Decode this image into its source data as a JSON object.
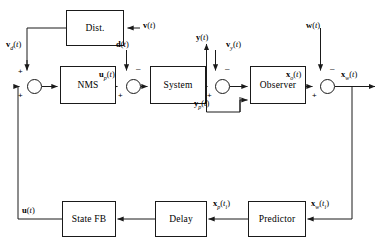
{
  "diagram": {
    "blocks": [
      {
        "id": "dist",
        "label": "Dist.",
        "x": 66,
        "y": 10,
        "w": 58,
        "h": 36
      },
      {
        "id": "nms",
        "label": "NMS",
        "x": 60,
        "y": 66,
        "w": 56,
        "h": 38
      },
      {
        "id": "system",
        "label": "System",
        "x": 150,
        "y": 66,
        "w": 56,
        "h": 38
      },
      {
        "id": "observer",
        "label": "Observer",
        "x": 250,
        "y": 66,
        "w": 56,
        "h": 38
      },
      {
        "id": "statefb",
        "label": "State FB",
        "x": 62,
        "y": 201,
        "w": 54,
        "h": 36
      },
      {
        "id": "delay",
        "label": "Delay",
        "x": 155,
        "y": 201,
        "w": 52,
        "h": 36
      },
      {
        "id": "predictor",
        "label": "Predictor",
        "x": 248,
        "y": 201,
        "w": 58,
        "h": 36
      }
    ],
    "junctions": [
      {
        "id": "sum-input",
        "x": 27,
        "y": 79,
        "d": 15
      },
      {
        "id": "sum-plant-input",
        "x": 126,
        "y": 79,
        "d": 15
      },
      {
        "id": "sum-output",
        "x": 215,
        "y": 79,
        "d": 15
      },
      {
        "id": "sum-state",
        "x": 320,
        "y": 79,
        "d": 15
      }
    ],
    "signals": [
      {
        "id": "v",
        "text": "v(t)",
        "x": 143,
        "y": 12
      },
      {
        "id": "vd",
        "text": "vd(t)",
        "x": 8,
        "y": 40
      },
      {
        "id": "d",
        "text": "d(t)",
        "x": 117,
        "y": 40
      },
      {
        "id": "up",
        "text": "up(t)",
        "x": 100,
        "y": 66
      },
      {
        "id": "y",
        "text": "y(t)",
        "x": 197,
        "y": 32
      },
      {
        "id": "vy",
        "text": "vy(t)",
        "x": 228,
        "y": 40
      },
      {
        "id": "yp",
        "text": "yp(t)",
        "x": 196,
        "y": 97
      },
      {
        "id": "w",
        "text": "w(t)",
        "x": 307,
        "y": 12
      },
      {
        "id": "xo",
        "text": "xo(t)",
        "x": 309,
        "y": 66
      },
      {
        "id": "xw",
        "text": "xw(t)",
        "x": 341,
        "y": 66
      },
      {
        "id": "u",
        "text": "u(t)",
        "x": 24,
        "y": 203
      },
      {
        "id": "xp",
        "text": "xp(ti)",
        "x": 214,
        "y": 196
      },
      {
        "id": "xwi",
        "text": "xw(ti)",
        "x": 312,
        "y": 196
      }
    ],
    "signs": [
      {
        "id": "sum-input-plus-top",
        "text": "+",
        "x": 18,
        "y": 68
      },
      {
        "id": "sum-input-plus-bottom",
        "text": "+",
        "x": 18,
        "y": 92
      },
      {
        "id": "sum-plant-plus",
        "text": "+",
        "x": 118,
        "y": 92
      },
      {
        "id": "sum-plant-minus",
        "text": "–",
        "x": 136,
        "y": 65
      },
      {
        "id": "sum-output-plus",
        "text": "+",
        "x": 207,
        "y": 92
      },
      {
        "id": "sum-output-minus",
        "text": "–",
        "x": 225,
        "y": 65
      },
      {
        "id": "sum-state-plus",
        "text": "+",
        "x": 312,
        "y": 92
      },
      {
        "id": "sum-state-minus",
        "text": "–",
        "x": 330,
        "y": 65
      }
    ]
  }
}
